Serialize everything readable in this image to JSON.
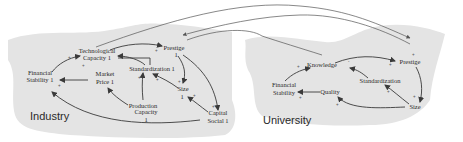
{
  "regions": {
    "industry": {
      "label": "Industry",
      "nodes": {
        "tech": [
          "Technological",
          "Capacity 1"
        ],
        "prestige": [
          "Prestige",
          "1"
        ],
        "financial": [
          "Financial",
          "Stability 1"
        ],
        "market": [
          "Market",
          "Price 1"
        ],
        "standard": [
          "Standardization 1"
        ],
        "size": [
          "Size",
          "1"
        ],
        "production": [
          "Production",
          "Capacity",
          "1"
        ],
        "capital": [
          "Capital",
          "Social 1"
        ]
      }
    },
    "university": {
      "label": "University",
      "nodes": {
        "knowledge": [
          "Knowledge"
        ],
        "prestige": [
          "Prestige"
        ],
        "financial": [
          "Financial",
          "Stability"
        ],
        "quality": [
          "Quality"
        ],
        "standard": [
          "Standardization"
        ],
        "size": [
          "Size"
        ]
      }
    }
  },
  "polarity": {
    "positive": "+",
    "negative": "-"
  },
  "colors": {
    "region_fill": "#e4e4e4",
    "edge": "#3a3a3a",
    "text": "#2a2a2a"
  }
}
